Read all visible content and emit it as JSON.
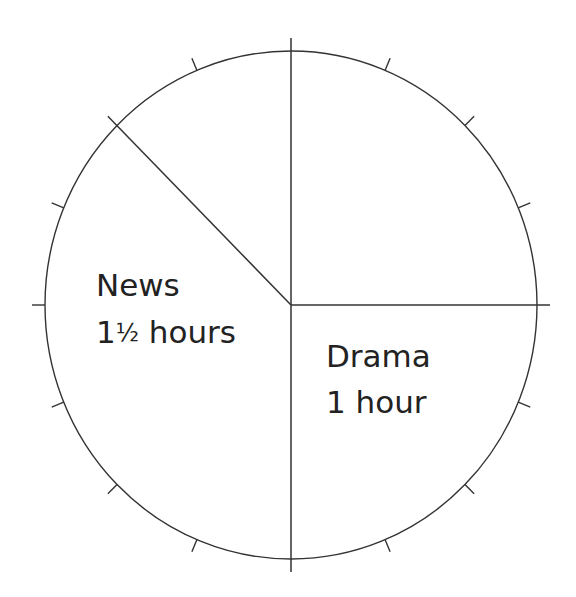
{
  "chart_data": {
    "type": "pie",
    "title": "",
    "unit": "hours",
    "total": 4,
    "tick_count": 16,
    "tick_interval_hours": 0.25,
    "start_angle_deg_from_top": 0,
    "direction": "clockwise",
    "slices": [
      {
        "name": "",
        "value": 1,
        "label_line1": "",
        "label_line2": "",
        "start_deg": 0,
        "end_deg": 90
      },
      {
        "name": "Drama",
        "value": 1,
        "label_line1": "Drama",
        "label_line2": "1 hour",
        "start_deg": 90,
        "end_deg": 180
      },
      {
        "name": "News",
        "value": 1.5,
        "label_line1": "News",
        "label_line2": "1½ hours",
        "start_deg": 180,
        "end_deg": 315
      },
      {
        "name": "",
        "value": 0.5,
        "label_line1": "",
        "label_line2": "",
        "start_deg": 315,
        "end_deg": 360
      }
    ],
    "categories": [
      "(unlabeled)",
      "Drama",
      "News",
      "(unlabeled)"
    ],
    "values": [
      1,
      1,
      1.5,
      0.5
    ],
    "legend": "none",
    "grid": false
  },
  "geometry": {
    "cx": 291,
    "cy": 305,
    "rx": 246,
    "ry": 254,
    "tick_length": 13,
    "line_color": "#333333"
  },
  "labels": {
    "news": {
      "line1": "News",
      "line2_whole": "1",
      "line2_frac": "½",
      "line2_rest": " hours"
    },
    "drama": {
      "line1": "Drama",
      "line2": "1 hour"
    }
  }
}
